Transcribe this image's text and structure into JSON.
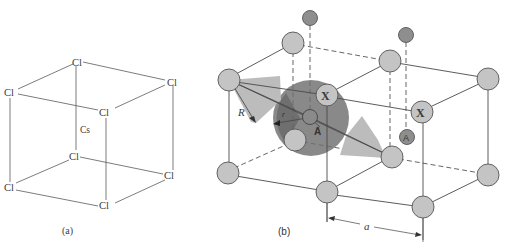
{
  "figure_a": {
    "caption": "(a)",
    "corner_label": "Cl",
    "center_label": "Cs",
    "corners": [
      {
        "id": "top-back",
        "label": "Cl"
      },
      {
        "id": "top-right",
        "label": "Cl"
      },
      {
        "id": "top-left",
        "label": "Cl"
      },
      {
        "id": "top-front",
        "label": "Cl"
      },
      {
        "id": "bottom-back",
        "label": "Cl"
      },
      {
        "id": "bottom-right",
        "label": "Cl"
      },
      {
        "id": "bottom-left",
        "label": "Cl"
      },
      {
        "id": "bottom-front",
        "label": "Cl"
      }
    ]
  },
  "figure_b": {
    "caption": "(b)",
    "labels": {
      "x_ion_1": "X",
      "x_ion_2": "X",
      "a_ion_1": "A",
      "a_ion_2": "A",
      "anion_radius": "R",
      "cation_radius": "r",
      "lattice_param": "a"
    },
    "colors": {
      "sphere_light": "#c4c4c4",
      "sphere_dark": "#8e8e8e",
      "big_sphere": "#7d7d7d",
      "wedge": "#bdbdbd"
    }
  }
}
